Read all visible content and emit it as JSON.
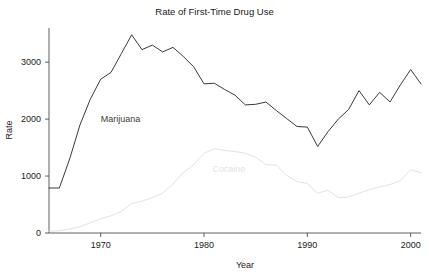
{
  "chart_data": {
    "type": "line",
    "title": "Rate of First-Time Drug Use",
    "xlabel": "Year",
    "ylabel": "Rate",
    "xlim": [
      1965,
      2001
    ],
    "ylim": [
      0,
      3600
    ],
    "xticks": [
      1970,
      1980,
      1990,
      2000
    ],
    "yticks": [
      0,
      1000,
      2000,
      3000
    ],
    "grid": false,
    "legend": "inline-labels",
    "x": [
      1965,
      1966,
      1967,
      1968,
      1969,
      1970,
      1971,
      1972,
      1973,
      1974,
      1975,
      1976,
      1977,
      1978,
      1979,
      1980,
      1981,
      1982,
      1983,
      1984,
      1985,
      1986,
      1987,
      1988,
      1989,
      1990,
      1991,
      1992,
      1993,
      1994,
      1995,
      1996,
      1997,
      1998,
      1999,
      2000,
      2001
    ],
    "series": [
      {
        "name": "Marijuana",
        "color": "#3a3a3a",
        "label_x": 1970.0,
        "label_y": 1950,
        "values": [
          790,
          790,
          1300,
          1900,
          2350,
          2700,
          2820,
          3150,
          3480,
          3220,
          3300,
          3180,
          3260,
          3100,
          2920,
          2620,
          2630,
          2520,
          2420,
          2250,
          2260,
          2300,
          2150,
          2010,
          1870,
          1860,
          1520,
          1780,
          2000,
          2170,
          2500,
          2250,
          2470,
          2300,
          2600,
          2870,
          2620
        ]
      },
      {
        "name": "Cocaine",
        "color": "#e3e3e3",
        "label_x": 1980.8,
        "label_y": 1080,
        "values": [
          30,
          40,
          70,
          110,
          180,
          250,
          300,
          380,
          520,
          560,
          620,
          700,
          860,
          1060,
          1200,
          1400,
          1480,
          1450,
          1430,
          1400,
          1330,
          1200,
          1190,
          1010,
          900,
          870,
          700,
          750,
          620,
          630,
          700,
          760,
          810,
          850,
          920,
          1110,
          1060
        ]
      }
    ]
  },
  "axes": {
    "y_tick_labels": [
      "0",
      "1000",
      "2000",
      "3000"
    ],
    "x_tick_labels": [
      "1970",
      "1980",
      "1990",
      "2000"
    ]
  }
}
